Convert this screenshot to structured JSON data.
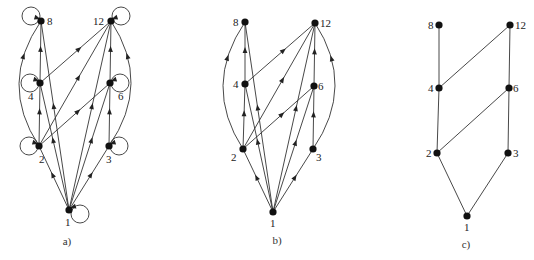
{
  "colors": {
    "ink": "#222222",
    "node": "#111111",
    "background": "#ffffff"
  },
  "panels": [
    {
      "id": "a",
      "label": "a)",
      "label_pos": [
        67,
        245
      ],
      "show_loops": true,
      "nodes": [
        {
          "id": "1",
          "x": 69,
          "y": 210,
          "label_dx": -4,
          "label_dy": 16,
          "loop": "right"
        },
        {
          "id": "2",
          "x": 39,
          "y": 146,
          "label_dx": 0,
          "label_dy": 17,
          "loop": "left"
        },
        {
          "id": "3",
          "x": 109,
          "y": 146,
          "label_dx": -3,
          "label_dy": 17,
          "loop": "right"
        },
        {
          "id": "4",
          "x": 40,
          "y": 83,
          "label_dx": -12,
          "label_dy": 17,
          "loop": "left"
        },
        {
          "id": "6",
          "x": 110,
          "y": 83,
          "label_dx": 8,
          "label_dy": 17,
          "loop": "right"
        },
        {
          "id": "8",
          "x": 41,
          "y": 21,
          "label_dx": 6,
          "label_dy": 4,
          "loop": "left"
        },
        {
          "id": "12",
          "x": 111,
          "y": 21,
          "label_dx": -18,
          "label_dy": 4,
          "loop": "right"
        }
      ],
      "edges": [
        {
          "from": "1",
          "to": "2"
        },
        {
          "from": "1",
          "to": "3"
        },
        {
          "from": "1",
          "to": "4"
        },
        {
          "from": "1",
          "to": "6"
        },
        {
          "from": "1",
          "to": "8"
        },
        {
          "from": "1",
          "to": "12"
        },
        {
          "from": "2",
          "to": "4"
        },
        {
          "from": "2",
          "to": "6"
        },
        {
          "from": "2",
          "to": "12"
        },
        {
          "from": "2",
          "to": "8",
          "curve": "left"
        },
        {
          "from": "3",
          "to": "6"
        },
        {
          "from": "3",
          "to": "12",
          "curve": "right"
        },
        {
          "from": "4",
          "to": "8"
        },
        {
          "from": "4",
          "to": "12"
        },
        {
          "from": "6",
          "to": "12"
        }
      ]
    },
    {
      "id": "b",
      "label": "b)",
      "label_pos": [
        277,
        244
      ],
      "show_loops": false,
      "nodes": [
        {
          "id": "1",
          "x": 273,
          "y": 212,
          "label_dx": -3,
          "label_dy": 15
        },
        {
          "id": "2",
          "x": 243,
          "y": 149,
          "label_dx": -12,
          "label_dy": 12
        },
        {
          "id": "3",
          "x": 313,
          "y": 149,
          "label_dx": 3,
          "label_dy": 12
        },
        {
          "id": "4",
          "x": 245,
          "y": 84,
          "label_dx": -12,
          "label_dy": 4
        },
        {
          "id": "6",
          "x": 314,
          "y": 86,
          "label_dx": 4,
          "label_dy": 4
        },
        {
          "id": "8",
          "x": 245,
          "y": 22,
          "label_dx": -12,
          "label_dy": 4
        },
        {
          "id": "12",
          "x": 315,
          "y": 23,
          "label_dx": 5,
          "label_dy": 4
        }
      ],
      "edges": [
        {
          "from": "1",
          "to": "2"
        },
        {
          "from": "1",
          "to": "3"
        },
        {
          "from": "1",
          "to": "4"
        },
        {
          "from": "1",
          "to": "6"
        },
        {
          "from": "1",
          "to": "8"
        },
        {
          "from": "1",
          "to": "12"
        },
        {
          "from": "2",
          "to": "4"
        },
        {
          "from": "2",
          "to": "6"
        },
        {
          "from": "2",
          "to": "12"
        },
        {
          "from": "2",
          "to": "8",
          "curve": "left"
        },
        {
          "from": "3",
          "to": "6"
        },
        {
          "from": "3",
          "to": "12",
          "curve": "right"
        },
        {
          "from": "4",
          "to": "8"
        },
        {
          "from": "4",
          "to": "12"
        },
        {
          "from": "6",
          "to": "12"
        }
      ]
    },
    {
      "id": "c",
      "label": "c)",
      "label_pos": [
        466,
        248
      ],
      "show_loops": false,
      "undirected": true,
      "nodes": [
        {
          "id": "1",
          "x": 467,
          "y": 216,
          "label_dx": -3,
          "label_dy": 15
        },
        {
          "id": "2",
          "x": 437,
          "y": 153,
          "label_dx": -11,
          "label_dy": 4
        },
        {
          "id": "3",
          "x": 508,
          "y": 153,
          "label_dx": 5,
          "label_dy": 4
        },
        {
          "id": "4",
          "x": 439,
          "y": 88,
          "label_dx": -11,
          "label_dy": 4
        },
        {
          "id": "6",
          "x": 509,
          "y": 88,
          "label_dx": 4,
          "label_dy": 4
        },
        {
          "id": "8",
          "x": 439,
          "y": 25,
          "label_dx": -11,
          "label_dy": 4
        },
        {
          "id": "12",
          "x": 510,
          "y": 25,
          "label_dx": 5,
          "label_dy": 4
        }
      ],
      "edges": [
        {
          "from": "1",
          "to": "2"
        },
        {
          "from": "1",
          "to": "3"
        },
        {
          "from": "2",
          "to": "4"
        },
        {
          "from": "2",
          "to": "6"
        },
        {
          "from": "3",
          "to": "6"
        },
        {
          "from": "4",
          "to": "8"
        },
        {
          "from": "4",
          "to": "12"
        },
        {
          "from": "6",
          "to": "12"
        }
      ]
    }
  ]
}
